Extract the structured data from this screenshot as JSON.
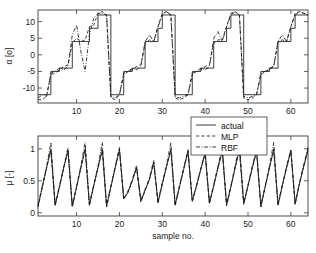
{
  "chart_data": [
    {
      "type": "line",
      "panel": "top",
      "title": "",
      "xlabel": "",
      "ylabel": "α [o]",
      "ylabel_parts": {
        "symbol": "α",
        "unit": "[o]"
      },
      "xlim": [
        1,
        64
      ],
      "ylim": [
        -14.5,
        13.5
      ],
      "xticks": [
        10,
        20,
        30,
        40,
        50,
        60
      ],
      "yticks": [
        -10,
        -5,
        0,
        5,
        10
      ],
      "ytick_labels": [
        "-10",
        "-5",
        "0",
        "5",
        "10"
      ],
      "xtick_labels": [
        "10",
        "20",
        "30",
        "40",
        "50",
        "60"
      ],
      "grid": false,
      "legend": null,
      "x": [
        1,
        2,
        3,
        4,
        5,
        6,
        7,
        8,
        9,
        10,
        11,
        12,
        13,
        14,
        15,
        16,
        17,
        18,
        19,
        20,
        21,
        22,
        23,
        24,
        25,
        26,
        27,
        28,
        29,
        30,
        31,
        32,
        33,
        34,
        35,
        36,
        37,
        38,
        39,
        40,
        41,
        42,
        43,
        44,
        45,
        46,
        47,
        48,
        49,
        50,
        51,
        52,
        53,
        54,
        55,
        56,
        57,
        58,
        59,
        60,
        61,
        62,
        63,
        64
      ],
      "series": [
        {
          "name": "actual",
          "style": "solid",
          "values": [
            -12,
            -12,
            -12,
            -5,
            -5,
            -4,
            -4,
            -4,
            4,
            4,
            4,
            4,
            8,
            8,
            12,
            12,
            12,
            -12,
            -12,
            -12,
            -5,
            -5,
            -4,
            -4,
            -4,
            4,
            4,
            4,
            8,
            12,
            12,
            12,
            -12,
            -12,
            -12,
            -12,
            -5,
            -5,
            -4,
            -4,
            -4,
            4,
            4,
            4,
            8,
            12,
            12,
            12,
            -12,
            -12,
            -12,
            -12,
            -5,
            -5,
            -4,
            -4,
            4,
            4,
            4,
            8,
            12,
            12,
            12,
            12
          ]
        },
        {
          "name": "MLP",
          "style": "dashed",
          "values": [
            -13.5,
            -13.5,
            -12.5,
            -6,
            -5.5,
            -4.5,
            -3.5,
            -3,
            3.5,
            5,
            4,
            4.5,
            8.5,
            9,
            12.5,
            13,
            12,
            -13,
            -13.5,
            -12,
            -6,
            -5,
            -4.5,
            -3.5,
            -3,
            3.5,
            4.5,
            4,
            8.5,
            12.5,
            13,
            12,
            -13,
            -13.5,
            -13,
            -12,
            -6,
            -5,
            -4.5,
            -3.5,
            -3,
            3.5,
            4.5,
            4.5,
            8.5,
            12.5,
            13,
            12,
            -13,
            -13.5,
            -13,
            -12,
            -6,
            -5,
            -4.5,
            -3.5,
            4,
            4.5,
            4,
            8.5,
            12.5,
            13,
            12.5,
            12
          ]
        },
        {
          "name": "RBF",
          "style": "dashdot",
          "values": [
            -13,
            -12,
            -12.5,
            -5.5,
            -5,
            -4,
            -4.5,
            -3.5,
            6,
            9,
            1,
            -5,
            6,
            11,
            12.5,
            12.5,
            12,
            -12.5,
            -13,
            -12,
            -5.5,
            -5,
            -4,
            -4.5,
            -3.5,
            4,
            6,
            4,
            8.5,
            12,
            13,
            12,
            -12.5,
            -13,
            -12.5,
            -12,
            -5.5,
            -5,
            -4,
            -4.5,
            -3.5,
            5,
            7,
            4,
            8.5,
            12,
            13,
            12,
            -12.5,
            -13,
            -12.5,
            -12,
            -5.5,
            -5,
            -4,
            -3.5,
            4,
            6,
            4,
            8.5,
            12,
            13,
            12.5,
            12
          ]
        }
      ]
    },
    {
      "type": "line",
      "panel": "bottom",
      "title": "",
      "xlabel": "sample no.",
      "ylabel": "μ [-]",
      "ylabel_parts": {
        "symbol": "μ",
        "unit": "[-]"
      },
      "xlim": [
        1,
        64
      ],
      "ylim": [
        -0.05,
        1.2
      ],
      "xticks": [
        10,
        20,
        30,
        40,
        50,
        60
      ],
      "yticks": [
        0,
        0.5,
        1
      ],
      "ytick_labels": [
        "0",
        "0.5",
        "1"
      ],
      "xtick_labels": [
        "10",
        "20",
        "30",
        "40",
        "50",
        "60"
      ],
      "grid": false,
      "legend": {
        "position": "top-right",
        "entries": [
          "actual",
          "MLP",
          "RBF"
        ]
      },
      "x": [
        1,
        2,
        3,
        4,
        5,
        6,
        7,
        8,
        9,
        10,
        11,
        12,
        13,
        14,
        15,
        16,
        17,
        18,
        19,
        20,
        21,
        22,
        23,
        24,
        25,
        26,
        27,
        28,
        29,
        30,
        31,
        32,
        33,
        34,
        35,
        36,
        37,
        38,
        39,
        40,
        41,
        42,
        43,
        44,
        45,
        46,
        47,
        48,
        49,
        50,
        51,
        52,
        53,
        54,
        55,
        56,
        57,
        58,
        59,
        60,
        61,
        62,
        63,
        64
      ],
      "series": [
        {
          "name": "actual",
          "style": "solid",
          "values": [
            0.1,
            0.4,
            0.7,
            0.98,
            0.12,
            0.4,
            0.7,
            0.96,
            0.1,
            0.4,
            0.7,
            0.99,
            0.12,
            0.42,
            0.7,
            0.98,
            0.1,
            0.4,
            0.7,
            0.98,
            0.22,
            0.32,
            0.5,
            0.7,
            0.18,
            0.35,
            0.52,
            0.78,
            0.16,
            0.45,
            0.72,
            0.98,
            0.12,
            0.4,
            0.68,
            0.95,
            0.18,
            0.42,
            0.68,
            0.92,
            0.15,
            0.42,
            0.7,
            0.96,
            0.12,
            0.4,
            0.7,
            0.98,
            0.14,
            0.42,
            0.7,
            0.95,
            0.1,
            0.4,
            0.7,
            0.98,
            0.12,
            0.42,
            0.7,
            0.96,
            0.14,
            0.45,
            0.72,
            0.98
          ]
        },
        {
          "name": "MLP",
          "style": "dashed",
          "values": [
            0.09,
            0.4,
            0.7,
            1.0,
            0.11,
            0.4,
            0.7,
            0.98,
            0.09,
            0.4,
            0.71,
            1.01,
            0.11,
            0.42,
            0.71,
            1.0,
            0.09,
            0.4,
            0.7,
            1.0,
            0.21,
            0.32,
            0.5,
            0.71,
            0.17,
            0.35,
            0.52,
            0.79,
            0.15,
            0.45,
            0.73,
            1.0,
            0.11,
            0.4,
            0.69,
            0.97,
            0.17,
            0.42,
            0.69,
            0.94,
            0.14,
            0.42,
            0.71,
            0.98,
            0.11,
            0.4,
            0.71,
            1.0,
            0.13,
            0.42,
            0.71,
            0.97,
            0.09,
            0.4,
            0.71,
            1.0,
            0.11,
            0.42,
            0.71,
            0.98,
            0.13,
            0.45,
            0.73,
            1.0
          ]
        },
        {
          "name": "RBF",
          "style": "dashdot",
          "values": [
            0.12,
            0.42,
            0.72,
            1.1,
            0.14,
            0.42,
            0.72,
            1.02,
            0.12,
            0.42,
            0.73,
            1.1,
            0.14,
            0.44,
            0.73,
            1.1,
            0.12,
            0.42,
            0.72,
            1.02,
            0.24,
            0.34,
            0.52,
            0.74,
            0.2,
            0.37,
            0.54,
            0.82,
            0.18,
            0.47,
            0.75,
            1.1,
            0.14,
            0.42,
            0.7,
            0.99,
            0.2,
            0.44,
            0.7,
            0.96,
            0.17,
            0.44,
            0.73,
            1.02,
            0.14,
            0.42,
            0.73,
            1.1,
            0.16,
            0.44,
            0.73,
            0.99,
            0.12,
            0.42,
            0.73,
            1.1,
            0.14,
            0.44,
            0.73,
            0.99,
            0.16,
            0.47,
            0.75,
            1.02
          ]
        }
      ]
    }
  ],
  "legend": {
    "entries": [
      {
        "label": "actual",
        "style": "solid"
      },
      {
        "label": "MLP",
        "style": "dashed"
      },
      {
        "label": "RBF",
        "style": "dashdot"
      }
    ]
  },
  "axes": {
    "top": {
      "ylabel_symbol": "α",
      "ylabel_unit": "[o]",
      "ytick_labels": [
        "10",
        "5",
        "0",
        "-5",
        "-10"
      ],
      "xtick_labels": [
        "10",
        "20",
        "30",
        "40",
        "50",
        "60"
      ]
    },
    "bottom": {
      "ylabel_symbol": "μ",
      "ylabel_unit": "[-]",
      "ytick_labels": [
        "1",
        "0.5",
        "0"
      ],
      "xtick_labels": [
        "10",
        "20",
        "30",
        "40",
        "50",
        "60"
      ],
      "xlabel": "sample no."
    }
  },
  "colors": {
    "line": "#1a1a1a",
    "axis": "#3a3a3a",
    "background": "#ffffff"
  }
}
